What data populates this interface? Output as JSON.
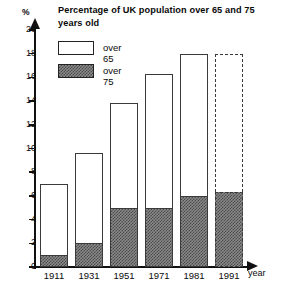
{
  "chart_data": {
    "type": "bar",
    "title": "Percentage of UK population over 65 and 75 years old",
    "xlabel": "year",
    "ylabel": "%",
    "categories": [
      "1911",
      "1931",
      "1951",
      "1971",
      "1981",
      "1991"
    ],
    "series": [
      {
        "name": "over 65",
        "values": [
          7.0,
          9.6,
          13.8,
          16.3,
          18.0,
          18.0
        ]
      },
      {
        "name": "over 75",
        "values": [
          1.0,
          2.0,
          5.0,
          5.0,
          6.0,
          6.3
        ]
      }
    ],
    "bar_styles": [
      "solid",
      "solid",
      "solid",
      "solid",
      "solid",
      "dashed"
    ],
    "projected_category": "1991",
    "ylim": [
      0,
      20
    ],
    "yticks": [
      0,
      2,
      4,
      6,
      8,
      10,
      12,
      14,
      16,
      18,
      20
    ],
    "ytick_labels": [
      "0",
      "2",
      "4",
      "6",
      "8",
      "10",
      "12",
      "14",
      "16",
      "18",
      "20"
    ],
    "grid": false,
    "legend_position": "top-left",
    "legend": [
      "over 65",
      "over 75"
    ],
    "colors": {
      "bar_outline": "#3a3a3a",
      "bar_fill": "#ffffff",
      "hatch_fill": "#8a8a8a",
      "axis": "#111111"
    }
  },
  "legend_items": [
    {
      "label": "over 65",
      "style": "open"
    },
    {
      "label": "over 75",
      "style": "hatched"
    }
  ]
}
